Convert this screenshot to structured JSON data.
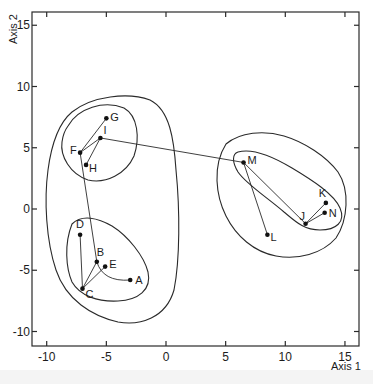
{
  "chart_data": {
    "type": "scatter",
    "title": "",
    "xlabel": "Axis 1",
    "ylabel": "Axis 2",
    "xlim": [
      -12.5,
      15.9
    ],
    "ylim": [
      -11,
      16
    ],
    "x_ticks": [
      -10,
      -5,
      0,
      5,
      10,
      15
    ],
    "y_ticks": [
      15,
      10,
      5,
      0,
      -5,
      -10
    ],
    "x_tick_labels": [
      "-10",
      "-5",
      "0",
      "5",
      "10",
      "15"
    ],
    "y_tick_labels": [
      "15",
      "10",
      "5",
      "0",
      "-5",
      "-10"
    ],
    "grid": false,
    "legend": null,
    "points": [
      {
        "label": "A",
        "x": -3.0,
        "y": -5.8
      },
      {
        "label": "B",
        "x": -5.8,
        "y": -4.3
      },
      {
        "label": "C",
        "x": -7.0,
        "y": -6.5
      },
      {
        "label": "D",
        "x": -7.2,
        "y": -2.1
      },
      {
        "label": "E",
        "x": -5.1,
        "y": -4.7
      },
      {
        "label": "F",
        "x": -7.2,
        "y": 4.6
      },
      {
        "label": "G",
        "x": -5.0,
        "y": 7.4
      },
      {
        "label": "H",
        "x": -6.7,
        "y": 3.6
      },
      {
        "label": "I",
        "x": -5.5,
        "y": 5.8
      },
      {
        "label": "J",
        "x": 11.7,
        "y": -1.2
      },
      {
        "label": "K",
        "x": 13.4,
        "y": 0.5
      },
      {
        "label": "L",
        "x": 8.5,
        "y": -2.1
      },
      {
        "label": "M",
        "x": 6.5,
        "y": 3.8
      },
      {
        "label": "N",
        "x": 13.3,
        "y": -0.3
      }
    ],
    "links": [
      [
        "F",
        "G"
      ],
      [
        "F",
        "I"
      ],
      [
        "I",
        "H"
      ],
      [
        "F",
        "B"
      ],
      [
        "C",
        "D"
      ],
      [
        "C",
        "B"
      ],
      [
        "C",
        "E"
      ],
      [
        "B",
        "A"
      ],
      [
        "I",
        "M"
      ],
      [
        "M",
        "L"
      ],
      [
        "M",
        "J"
      ],
      [
        "J",
        "K"
      ],
      [
        "J",
        "N"
      ]
    ],
    "clusters": [
      {
        "name": "inner-FGHI",
        "members": [
          "F",
          "G",
          "H",
          "I"
        ]
      },
      {
        "name": "inner-ABCDE",
        "members": [
          "A",
          "B",
          "C",
          "D",
          "E"
        ]
      },
      {
        "name": "outer-left",
        "members": [
          "A",
          "B",
          "C",
          "D",
          "E",
          "F",
          "G",
          "H",
          "I"
        ]
      },
      {
        "name": "inner-JKMN",
        "members": [
          "J",
          "K",
          "M",
          "N"
        ]
      },
      {
        "name": "outer-right",
        "members": [
          "J",
          "K",
          "L",
          "M",
          "N"
        ]
      }
    ]
  },
  "axes": {
    "x_title": "Axis 1",
    "y_title": "Axis 2"
  },
  "colors": {
    "ink": "#1c1c1c",
    "background": "#ffffff"
  }
}
